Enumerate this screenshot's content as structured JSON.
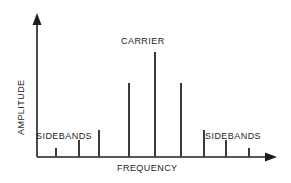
{
  "figure": {
    "background_color": "#ffffff",
    "line_color": "#3a3a3a",
    "axis_color": "#1e1e1e",
    "text_color": "#1e1e1e"
  },
  "labels": {
    "amplitude": "AMPLITUDE",
    "frequency": "FREQUENCY",
    "carrier": "CARRIER",
    "sidebands_left": "SIDEBANDS",
    "sidebands_right": "SIDEBANDS"
  },
  "chart_data": {
    "type": "bar",
    "title": "",
    "xlabel": "FREQUENCY",
    "ylabel": "AMPLITUDE",
    "grid": false,
    "legend": "none",
    "xlim": [
      0,
      10
    ],
    "ylim": [
      0,
      1
    ],
    "annotations": [
      {
        "text": "CARRIER",
        "x": 5,
        "y": 0.92
      },
      {
        "text": "SIDEBANDS",
        "x": 1.6,
        "y": 0.27
      },
      {
        "text": "SIDEBANDS",
        "x": 8.4,
        "y": 0.27
      }
    ],
    "categories": [
      "-4",
      "-3",
      "-2",
      "-1",
      "0",
      "1",
      "2",
      "3",
      "4"
    ],
    "values": [
      0.06,
      0.18,
      0.26,
      0.66,
      1.0,
      0.66,
      0.26,
      0.18,
      0.06
    ],
    "series": [
      {
        "name": "spectrum",
        "values": [
          0.06,
          0.18,
          0.26,
          0.66,
          1.0,
          0.66,
          0.26,
          0.18,
          0.06
        ]
      }
    ],
    "lines_px": [
      {
        "name": "sideband-4-left",
        "x": 55,
        "top": 148,
        "bottom": 157
      },
      {
        "name": "sideband-3-left",
        "x": 78,
        "top": 140,
        "bottom": 157
      },
      {
        "name": "sideband-2-left",
        "x": 98,
        "top": 130,
        "bottom": 157
      },
      {
        "name": "sideband-1-left",
        "x": 128,
        "top": 83,
        "bottom": 157
      },
      {
        "name": "carrier",
        "x": 154,
        "top": 52,
        "bottom": 157
      },
      {
        "name": "sideband-1-right",
        "x": 180,
        "top": 83,
        "bottom": 157
      },
      {
        "name": "sideband-2-right",
        "x": 203,
        "top": 130,
        "bottom": 157
      },
      {
        "name": "sideband-3-right",
        "x": 225,
        "top": 140,
        "bottom": 157
      },
      {
        "name": "sideband-4-right",
        "x": 248,
        "top": 148,
        "bottom": 157
      }
    ]
  }
}
